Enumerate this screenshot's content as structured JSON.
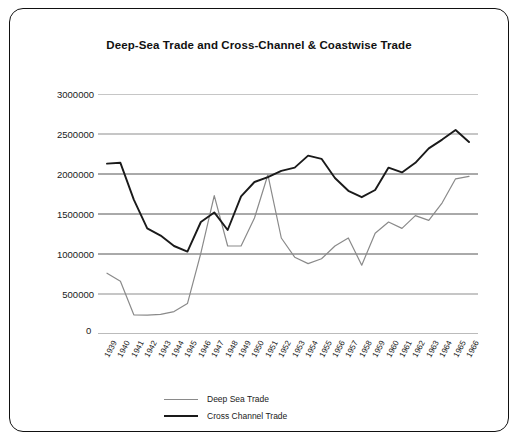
{
  "chart_data": {
    "type": "line",
    "title": "Deep-Sea Trade and Cross-Channel & Coastwise Trade",
    "xlabel": "",
    "ylabel": "",
    "ylim": [
      0,
      3000000
    ],
    "yticks": [
      0,
      500000,
      1000000,
      1500000,
      2000000,
      2500000,
      3000000
    ],
    "ytick_labels": [
      "0",
      "500000",
      "1000000",
      "1500000",
      "2000000",
      "2500000",
      "3000000"
    ],
    "grid": true,
    "legend_position": "bottom",
    "categories": [
      "1939",
      "1940",
      "1941",
      "1942",
      "1943",
      "1944",
      "1945",
      "1946",
      "1947",
      "1948",
      "1949",
      "1950",
      "1951",
      "1952",
      "1953",
      "1954",
      "1955",
      "1956",
      "1957",
      "1958",
      "1959",
      "1960",
      "1961",
      "1962",
      "1963",
      "1964",
      "1965",
      "1966"
    ],
    "series": [
      {
        "name": "Deep Sea Trade",
        "color": "#8a8a8a",
        "values": [
          760000,
          660000,
          240000,
          235000,
          245000,
          280000,
          380000,
          1010000,
          1730000,
          1100000,
          1100000,
          1450000,
          1990000,
          1200000,
          960000,
          880000,
          940000,
          1100000,
          1200000,
          860000,
          1260000,
          1400000,
          1320000,
          1480000,
          1420000,
          1640000,
          1940000,
          1970000
        ]
      },
      {
        "name": "Cross Channel Trade",
        "color": "#1a1a1a",
        "values": [
          2130000,
          2140000,
          1680000,
          1320000,
          1230000,
          1100000,
          1030000,
          1400000,
          1520000,
          1300000,
          1720000,
          1900000,
          1960000,
          2040000,
          2080000,
          2230000,
          2190000,
          1950000,
          1790000,
          1710000,
          1800000,
          2080000,
          2020000,
          2140000,
          2320000,
          2430000,
          2550000,
          2400000
        ]
      }
    ]
  },
  "legend": {
    "entries": [
      {
        "label": "Deep Sea Trade"
      },
      {
        "label": "Cross Channel Trade"
      }
    ]
  }
}
